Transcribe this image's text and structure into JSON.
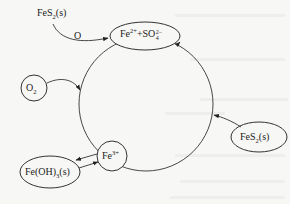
{
  "diagram": {
    "type": "cycle",
    "nodes": {
      "top_reactant": {
        "base": "FeS",
        "sub": "2",
        "suffix": "(s)"
      },
      "sulfate_ion": {
        "fe": "Fe",
        "fe_charge": "2+",
        "plus": "+SO",
        "so_sub": "4",
        "so_charge": "2−"
      },
      "oxygen": {
        "base": "O",
        "sub": "2"
      },
      "ferric_ion": {
        "base": "Fe",
        "charge": "3+"
      },
      "ferric_hydroxide": {
        "base": "Fe(OH)",
        "sub": "3",
        "suffix": "(s)"
      },
      "pyrite_right": {
        "base": "FeS",
        "sub": "2",
        "suffix": "(s)"
      }
    },
    "edges": [
      {
        "from": "FeS2(s) top",
        "to": "Fe2+ + SO4 2-",
        "label": "O"
      },
      {
        "from": "O2",
        "to": "cycle"
      },
      {
        "from": "Fe3+",
        "to": "Fe(OH)3(s)"
      },
      {
        "from": "Fe(OH)3(s)",
        "to": "Fe3+"
      },
      {
        "from": "FeS2(s) right",
        "to": "cycle (toward Fe2+ + SO4 2-)"
      }
    ],
    "edge_label_o": "O"
  }
}
